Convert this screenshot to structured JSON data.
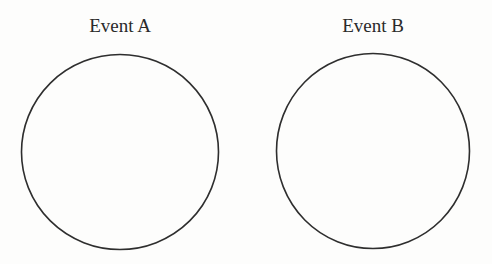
{
  "figure": {
    "type": "venn-disjoint",
    "stroke_color": "#2e2e2e",
    "background": "#fdfdfc",
    "events": [
      {
        "label": "Event A",
        "label_center_x": 120,
        "cx": 120,
        "cy": 152,
        "rx": 98.5,
        "ry": 97.5
      },
      {
        "label": "Event B",
        "label_center_x": 373,
        "cx": 373,
        "cy": 151,
        "rx": 96.5,
        "ry": 97.5
      }
    ]
  }
}
